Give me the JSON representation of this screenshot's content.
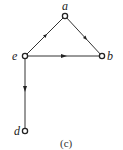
{
  "diagram": {
    "type": "directed-graph",
    "caption": "(c)",
    "nodes": [
      {
        "id": "a",
        "label": "a",
        "x": 65,
        "y": 16
      },
      {
        "id": "b",
        "label": "b",
        "x": 102,
        "y": 56
      },
      {
        "id": "e",
        "label": "e",
        "x": 25,
        "y": 56
      },
      {
        "id": "d",
        "label": "d",
        "x": 25,
        "y": 131
      }
    ],
    "edges": [
      {
        "from": "e",
        "to": "a"
      },
      {
        "from": "a",
        "to": "b"
      },
      {
        "from": "e",
        "to": "b"
      },
      {
        "from": "e",
        "to": "d"
      }
    ],
    "colors": {
      "line": "#333333",
      "node_fill": "#ffffff"
    }
  }
}
